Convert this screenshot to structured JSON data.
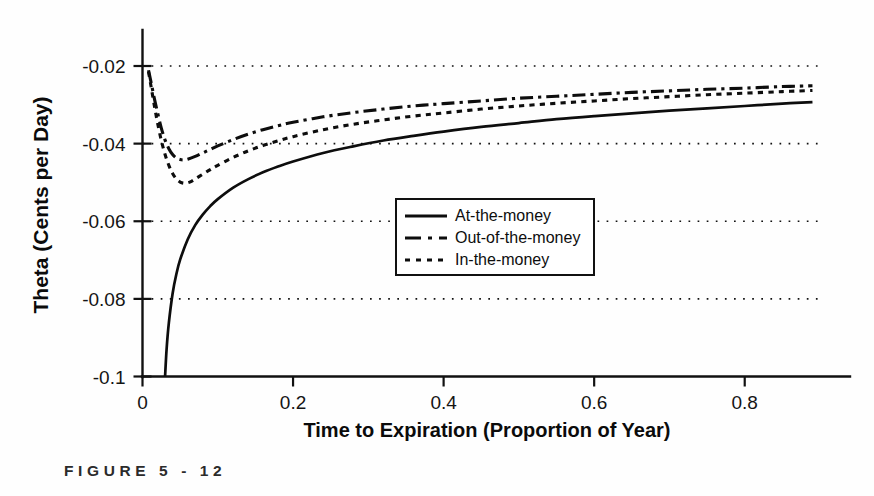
{
  "figure": {
    "caption": "FIGURE  5 - 12",
    "background_color": "#fefefe",
    "ink_color": "#111111"
  },
  "chart_data": {
    "type": "line",
    "title": "",
    "xlabel": "Time to Expiration (Proportion of Year)",
    "ylabel": "Theta (Cents per Day)",
    "xlim": [
      0,
      0.9
    ],
    "ylim": [
      -0.1,
      -0.014
    ],
    "xticks": [
      0,
      0.2,
      0.4,
      0.6,
      0.8
    ],
    "xtick_labels": [
      "0",
      "0.2",
      "0.4",
      "0.6",
      "0.8"
    ],
    "yticks": [
      -0.02,
      -0.04,
      -0.06,
      -0.08,
      -0.1
    ],
    "ytick_labels": [
      "-0.02",
      "-0.04",
      "-0.06",
      "-0.08",
      "-0.1"
    ],
    "grid": "horizontal-dotted",
    "legend_position": "center",
    "series": [
      {
        "name": "At-the-money",
        "style": "solid",
        "x": [
          0.03,
          0.032,
          0.035,
          0.04,
          0.045,
          0.05,
          0.06,
          0.07,
          0.08,
          0.09,
          0.1,
          0.12,
          0.14,
          0.16,
          0.18,
          0.2,
          0.24,
          0.28,
          0.32,
          0.36,
          0.4,
          0.45,
          0.5,
          0.55,
          0.6,
          0.65,
          0.7,
          0.75,
          0.8,
          0.85,
          0.89
        ],
        "y": [
          -0.1,
          -0.093,
          -0.0862,
          -0.0786,
          -0.0736,
          -0.0699,
          -0.0647,
          -0.061,
          -0.0583,
          -0.0561,
          -0.0543,
          -0.0514,
          -0.0492,
          -0.0474,
          -0.0459,
          -0.0446,
          -0.0424,
          -0.0407,
          -0.0392,
          -0.038,
          -0.0369,
          -0.0357,
          -0.0347,
          -0.0337,
          -0.0329,
          -0.0322,
          -0.0315,
          -0.0309,
          -0.0303,
          -0.0297,
          -0.0293
        ]
      },
      {
        "name": "Out-of-the-money",
        "style": "dash-dot",
        "x": [
          0.008,
          0.012,
          0.016,
          0.02,
          0.025,
          0.03,
          0.035,
          0.04,
          0.045,
          0.05,
          0.055,
          0.06,
          0.07,
          0.08,
          0.09,
          0.1,
          0.12,
          0.14,
          0.16,
          0.18,
          0.2,
          0.24,
          0.28,
          0.32,
          0.36,
          0.4,
          0.45,
          0.5,
          0.55,
          0.6,
          0.65,
          0.7,
          0.75,
          0.8,
          0.85,
          0.89
        ],
        "y": [
          -0.0211,
          -0.0248,
          -0.0286,
          -0.032,
          -0.036,
          -0.0391,
          -0.0413,
          -0.0428,
          -0.0437,
          -0.0441,
          -0.0442,
          -0.044,
          -0.0433,
          -0.0424,
          -0.0415,
          -0.0406,
          -0.039,
          -0.0376,
          -0.0364,
          -0.0354,
          -0.0345,
          -0.0331,
          -0.032,
          -0.0311,
          -0.0303,
          -0.0297,
          -0.029,
          -0.0283,
          -0.0278,
          -0.0273,
          -0.0268,
          -0.0264,
          -0.026,
          -0.0257,
          -0.0253,
          -0.0251
        ]
      },
      {
        "name": "In-the-money",
        "style": "dotted",
        "x": [
          0.008,
          0.012,
          0.016,
          0.02,
          0.025,
          0.03,
          0.035,
          0.04,
          0.045,
          0.05,
          0.055,
          0.06,
          0.065,
          0.07,
          0.08,
          0.09,
          0.1,
          0.12,
          0.14,
          0.16,
          0.18,
          0.2,
          0.24,
          0.28,
          0.32,
          0.36,
          0.4,
          0.45,
          0.5,
          0.55,
          0.6,
          0.65,
          0.7,
          0.75,
          0.8,
          0.85,
          0.89
        ],
        "y": [
          -0.0215,
          -0.026,
          -0.0305,
          -0.0347,
          -0.0392,
          -0.0428,
          -0.0456,
          -0.0477,
          -0.0491,
          -0.0499,
          -0.0502,
          -0.0501,
          -0.0497,
          -0.0491,
          -0.0479,
          -0.0467,
          -0.0456,
          -0.0436,
          -0.0419,
          -0.0405,
          -0.0393,
          -0.0382,
          -0.0364,
          -0.035,
          -0.0339,
          -0.0329,
          -0.0321,
          -0.0311,
          -0.0303,
          -0.0296,
          -0.029,
          -0.0284,
          -0.0279,
          -0.0274,
          -0.027,
          -0.0266,
          -0.0263
        ]
      }
    ]
  },
  "legend": {
    "items": [
      {
        "label": "At-the-money",
        "style": "solid"
      },
      {
        "label": "Out-of-the-money",
        "style": "dash-dot"
      },
      {
        "label": "In-the-money",
        "style": "dotted"
      }
    ]
  }
}
